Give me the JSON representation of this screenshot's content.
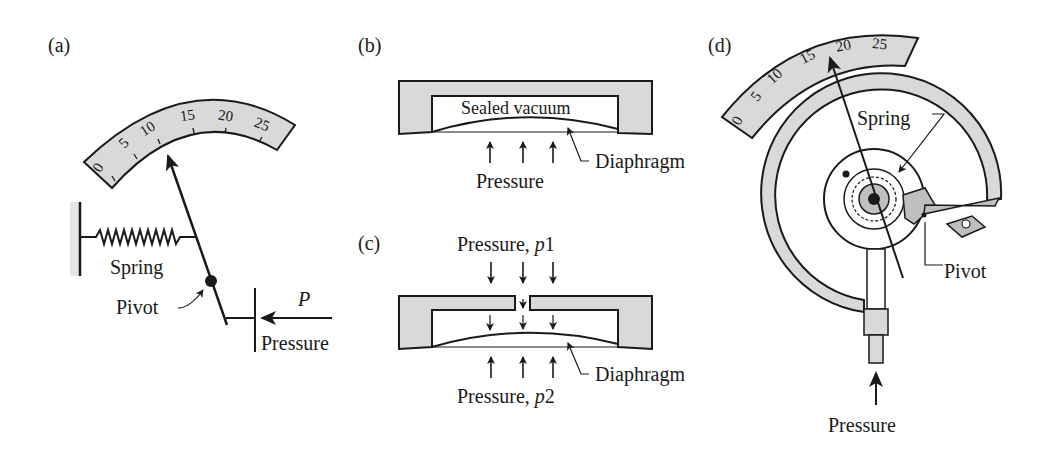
{
  "figure": {
    "panels": [
      {
        "id": "a",
        "label": "(a)",
        "scale_ticks": [
          "0",
          "5",
          "10",
          "15",
          "20",
          "25"
        ],
        "labels": {
          "spring": "Spring",
          "pivot": "Pivot",
          "force": "P",
          "pressure": "Pressure"
        }
      },
      {
        "id": "b",
        "label": "(b)",
        "labels": {
          "chamber": "Sealed vacuum",
          "diaphragm": "Diaphragm",
          "pressure": "Pressure"
        }
      },
      {
        "id": "c",
        "label": "(c)",
        "labels": {
          "top_pressure_prefix": "Pressure, ",
          "top_pressure_var": "p",
          "top_pressure_sub": "1",
          "bottom_pressure_prefix": "Pressure, ",
          "bottom_pressure_var": "p",
          "bottom_pressure_sub": "2",
          "diaphragm": "Diaphragm"
        }
      },
      {
        "id": "d",
        "label": "(d)",
        "scale_ticks": [
          "0",
          "5",
          "10",
          "15",
          "20",
          "25"
        ],
        "labels": {
          "spring": "Spring",
          "pivot": "Pivot",
          "pressure": "Pressure"
        }
      }
    ]
  },
  "colors": {
    "fill_gray": "#d9d9d9",
    "ink": "#1a1a1a",
    "background": "#ffffff"
  }
}
